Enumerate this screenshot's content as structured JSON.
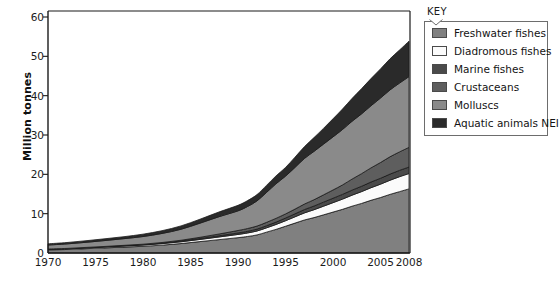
{
  "chart_data": {
    "type": "area",
    "stacked": true,
    "title": "",
    "xlabel": "",
    "ylabel": "Million tonnes",
    "xlim": [
      1970,
      2008
    ],
    "ylim": [
      0,
      60
    ],
    "ytick_values": [
      0,
      10,
      20,
      30,
      40,
      50,
      60
    ],
    "ytick_labels": [
      "0",
      "10",
      "20",
      "30",
      "40",
      "50",
      "60"
    ],
    "xtick_values": [
      1970,
      1975,
      1980,
      1985,
      1990,
      1995,
      2000,
      2005,
      2008
    ],
    "xtick_labels": [
      "1970",
      "1975",
      "1980",
      "1985",
      "1990",
      "1995",
      "2000",
      "2005",
      "2008"
    ],
    "grid": false,
    "legend_position": "right",
    "x": [
      1970,
      1972,
      1974,
      1976,
      1978,
      1980,
      1982,
      1984,
      1986,
      1988,
      1990,
      1991,
      1992,
      1993,
      1994,
      1995,
      1996,
      1997,
      1998,
      1999,
      2000,
      2001,
      2002,
      2003,
      2004,
      2005,
      2006,
      2007,
      2008
    ],
    "series": [
      {
        "name": "Freshwater fishes",
        "color": "#808080",
        "values": [
          0.8,
          0.9,
          1.1,
          1.3,
          1.5,
          1.7,
          2.0,
          2.4,
          2.9,
          3.4,
          3.9,
          4.2,
          4.6,
          5.3,
          6.0,
          6.8,
          7.6,
          8.4,
          9.0,
          9.7,
          10.4,
          11.1,
          11.9,
          12.6,
          13.4,
          14.1,
          14.9,
          15.6,
          16.3
        ]
      },
      {
        "name": "Diadromous fishes",
        "color": "#fbfbfb",
        "values": [
          0.15,
          0.17,
          0.2,
          0.23,
          0.27,
          0.32,
          0.38,
          0.45,
          0.55,
          0.68,
          0.82,
          0.9,
          1.0,
          1.1,
          1.25,
          1.4,
          1.6,
          1.8,
          2.0,
          2.2,
          2.4,
          2.6,
          2.8,
          3.0,
          3.2,
          3.4,
          3.6,
          3.8,
          3.9
        ]
      },
      {
        "name": "Marine fishes",
        "color": "#4a4a4a",
        "values": [
          0.05,
          0.06,
          0.07,
          0.08,
          0.1,
          0.12,
          0.15,
          0.19,
          0.24,
          0.3,
          0.38,
          0.42,
          0.47,
          0.53,
          0.6,
          0.68,
          0.76,
          0.85,
          0.94,
          1.03,
          1.12,
          1.2,
          1.28,
          1.36,
          1.44,
          1.5,
          1.56,
          1.6,
          1.65
        ]
      },
      {
        "name": "Crustaceans",
        "color": "#5e5e5e",
        "values": [
          0.03,
          0.04,
          0.05,
          0.06,
          0.08,
          0.1,
          0.14,
          0.2,
          0.3,
          0.45,
          0.62,
          0.7,
          0.78,
          0.86,
          0.95,
          1.05,
          1.2,
          1.4,
          1.6,
          1.85,
          2.1,
          2.4,
          2.8,
          3.2,
          3.6,
          4.0,
          4.4,
          4.7,
          5.0
        ]
      },
      {
        "name": "Molluscs",
        "color": "#8a8a8a",
        "values": [
          1.0,
          1.15,
          1.3,
          1.5,
          1.7,
          1.95,
          2.3,
          2.8,
          3.6,
          4.4,
          5.0,
          5.6,
          6.4,
          7.6,
          8.8,
          9.6,
          10.6,
          11.6,
          12.3,
          12.9,
          13.5,
          14.1,
          14.7,
          15.2,
          15.8,
          16.4,
          17.0,
          17.5,
          18.0
        ]
      },
      {
        "name": "Aquatic animals NEI",
        "color": "#2a2a2a",
        "values": [
          0.3,
          0.35,
          0.4,
          0.45,
          0.5,
          0.6,
          0.7,
          0.85,
          1.0,
          1.2,
          1.4,
          1.5,
          1.6,
          1.8,
          2.0,
          2.2,
          2.6,
          3.0,
          3.5,
          4.0,
          4.6,
          5.2,
          5.8,
          6.4,
          6.9,
          7.4,
          7.9,
          8.4,
          9.0
        ]
      }
    ]
  },
  "legend": {
    "title": "KEY",
    "items": [
      {
        "label": "Freshwater fishes",
        "color": "#808080"
      },
      {
        "label": "Diadromous fishes",
        "color": "#fbfbfb"
      },
      {
        "label": "Marine fishes",
        "color": "#4a4a4a"
      },
      {
        "label": "Crustaceans",
        "color": "#5e5e5e"
      },
      {
        "label": "Molluscs",
        "color": "#8a8a8a"
      },
      {
        "label": "Aquatic animals NEI",
        "color": "#2a2a2a"
      }
    ]
  }
}
